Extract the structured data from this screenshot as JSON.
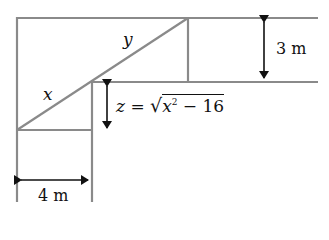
{
  "diagram": {
    "type": "corridor-ladder-geometry",
    "colors": {
      "line": "#8a8a8a",
      "arrow": "#111111",
      "text": "#111111"
    },
    "labels": {
      "x": "x",
      "y": "y",
      "z_equation": "z = √x² − 16",
      "z_var": "z",
      "z_eq_sign": "=",
      "z_radicand_var": "x",
      "z_radicand_exp": "2",
      "z_radicand_rest": " − 16",
      "width_top": "3 m",
      "width_left": "4 m"
    },
    "arrows": [
      {
        "name": "dimension-3m",
        "orientation": "vertical",
        "double_headed": true
      },
      {
        "name": "dimension-z",
        "orientation": "vertical",
        "double_headed": true
      },
      {
        "name": "dimension-4m",
        "orientation": "horizontal",
        "double_headed": true
      }
    ]
  }
}
